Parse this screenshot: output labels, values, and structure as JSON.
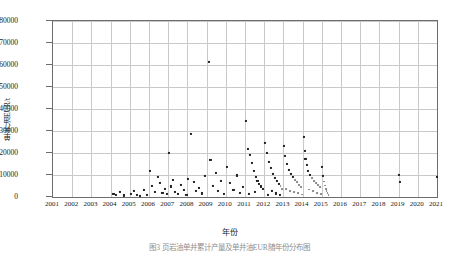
{
  "figure": {
    "xlabel": "年份",
    "ylabel": "单井油EUR/t",
    "caption": "图3  页岩油单井累计产量及单井油EUR随年份分布图"
  },
  "chart_data": {
    "type": "scatter",
    "title": "",
    "xlabel": "年份",
    "ylabel": "单井油EUR/t",
    "xlim": [
      2001,
      2021
    ],
    "ylim": [
      0,
      80000
    ],
    "yticks": [
      0,
      10000,
      20000,
      30000,
      40000,
      50000,
      60000,
      70000,
      80000
    ],
    "xticks": [
      2001,
      2002,
      2003,
      2004,
      2005,
      2006,
      2007,
      2008,
      2009,
      2010,
      2011,
      2012,
      2013,
      2014,
      2015,
      2016,
      2017,
      2018,
      2019,
      2020,
      2021
    ],
    "grid": true,
    "legend": false,
    "marker": "square",
    "marker_color": "#222222",
    "points": [
      [
        2004.15,
        1200
      ],
      [
        2004.3,
        900
      ],
      [
        2004.5,
        2100
      ],
      [
        2004.7,
        700
      ],
      [
        2005.05,
        1500
      ],
      [
        2005.2,
        2800
      ],
      [
        2005.35,
        1000
      ],
      [
        2005.55,
        600
      ],
      [
        2005.75,
        3200
      ],
      [
        2005.9,
        1100
      ],
      [
        2006.05,
        12000
      ],
      [
        2006.15,
        5200
      ],
      [
        2006.3,
        2400
      ],
      [
        2006.45,
        9000
      ],
      [
        2006.55,
        6400
      ],
      [
        2006.7,
        1800
      ],
      [
        2006.85,
        3600
      ],
      [
        2006.95,
        1200
      ],
      [
        2007.05,
        20200
      ],
      [
        2007.15,
        4800
      ],
      [
        2007.25,
        7600
      ],
      [
        2007.35,
        2200
      ],
      [
        2007.5,
        1400
      ],
      [
        2007.65,
        5600
      ],
      [
        2007.8,
        3000
      ],
      [
        2007.95,
        1000
      ],
      [
        2008.05,
        8000
      ],
      [
        2008.2,
        28500
      ],
      [
        2008.35,
        6800
      ],
      [
        2008.45,
        2600
      ],
      [
        2008.6,
        4200
      ],
      [
        2008.75,
        1600
      ],
      [
        2008.9,
        9400
      ],
      [
        2009.1,
        61200
      ],
      [
        2009.2,
        16800
      ],
      [
        2009.35,
        5000
      ],
      [
        2009.5,
        11000
      ],
      [
        2009.6,
        2800
      ],
      [
        2009.75,
        7200
      ],
      [
        2009.9,
        1500
      ],
      [
        2010.05,
        13800
      ],
      [
        2010.2,
        6200
      ],
      [
        2010.4,
        3400
      ],
      [
        2010.6,
        9800
      ],
      [
        2010.75,
        2000
      ],
      [
        2010.9,
        4600
      ],
      [
        2011.05,
        34500
      ],
      [
        2011.15,
        22000
      ],
      [
        2011.25,
        19000
      ],
      [
        2011.35,
        15500
      ],
      [
        2011.45,
        11800
      ],
      [
        2011.55,
        9200
      ],
      [
        2011.65,
        7400
      ],
      [
        2011.75,
        6000
      ],
      [
        2011.85,
        4800
      ],
      [
        2011.95,
        3600
      ],
      [
        2011.5,
        2400
      ],
      [
        2011.2,
        1400
      ],
      [
        2012.05,
        24500
      ],
      [
        2012.15,
        20000
      ],
      [
        2012.25,
        16000
      ],
      [
        2012.35,
        13000
      ],
      [
        2012.45,
        10600
      ],
      [
        2012.55,
        8800
      ],
      [
        2012.65,
        7200
      ],
      [
        2012.75,
        6000
      ],
      [
        2012.85,
        4800
      ],
      [
        2012.95,
        3800
      ],
      [
        2012.4,
        2600
      ],
      [
        2012.6,
        1600
      ],
      [
        2012.2,
        1100
      ],
      [
        2012.8,
        900
      ],
      [
        2013.05,
        23000
      ],
      [
        2013.1,
        18500
      ],
      [
        2013.2,
        15000
      ],
      [
        2013.3,
        12500
      ],
      [
        2013.4,
        10500
      ],
      [
        2013.5,
        9000
      ],
      [
        2013.6,
        7800
      ],
      [
        2013.7,
        6600
      ],
      [
        2013.8,
        5600
      ],
      [
        2013.9,
        4600
      ],
      [
        2013.15,
        3600
      ],
      [
        2013.35,
        2800
      ],
      [
        2013.55,
        2200
      ],
      [
        2013.75,
        1600
      ],
      [
        2013.95,
        1100
      ],
      [
        2014.05,
        27500
      ],
      [
        2014.1,
        21000
      ],
      [
        2014.15,
        17500
      ],
      [
        2014.25,
        14500
      ],
      [
        2014.3,
        12000
      ],
      [
        2014.4,
        10000
      ],
      [
        2014.5,
        8600
      ],
      [
        2014.6,
        7400
      ],
      [
        2014.7,
        6400
      ],
      [
        2014.8,
        5400
      ],
      [
        2014.9,
        4400
      ],
      [
        2014.35,
        3400
      ],
      [
        2014.55,
        2600
      ],
      [
        2014.75,
        1800
      ],
      [
        2014.95,
        1200
      ],
      [
        2015.0,
        13500
      ],
      [
        2015.05,
        9600
      ],
      [
        2015.1,
        7000
      ],
      [
        2015.15,
        5200
      ],
      [
        2015.2,
        3800
      ],
      [
        2015.25,
        2600
      ],
      [
        2015.3,
        1600
      ],
      [
        2015.35,
        1000
      ],
      [
        2019.0,
        10200
      ],
      [
        2019.05,
        7000
      ],
      [
        2021.0,
        9000
      ]
    ]
  }
}
